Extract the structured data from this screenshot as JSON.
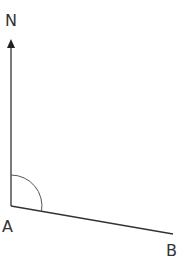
{
  "diagram": {
    "type": "bearing-angle",
    "labels": {
      "north": "N",
      "vertex": "A",
      "endpoint": "B"
    },
    "colors": {
      "line": "#333333",
      "arc": "#555555",
      "text": "#333333",
      "background": "#ffffff"
    },
    "points": {
      "vertex": {
        "x": 11,
        "y": 206
      },
      "north_tip": {
        "x": 11,
        "y": 40
      },
      "endpoint": {
        "x": 173,
        "y": 234
      }
    },
    "angle_marker": {
      "radius": 31,
      "description": "angle measured clockwise from North to AB"
    }
  }
}
